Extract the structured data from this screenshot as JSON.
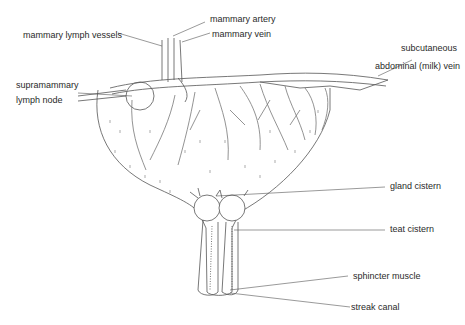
{
  "diagram": {
    "labels": {
      "mammary_artery": "mammary artery",
      "mammary_lymph_vessels": "mammary lymph vessels",
      "mammary_vein": "mammary vein",
      "subcutaneous_line1": "subcutaneous",
      "subcutaneous_line2": "abdominal (milk) vein",
      "supramammary_line1": "supramammary",
      "supramammary_line2": "lymph node",
      "gland_cistern": "gland cistern",
      "teat_cistern": "teat cistern",
      "sphincter_muscle": "sphincter muscle",
      "streak_canal": "streak canal"
    },
    "colors": {
      "line": "#555555",
      "text": "#2a2a2a",
      "vessel_fill": "#e6e3dc",
      "background": "#ffffff"
    }
  }
}
